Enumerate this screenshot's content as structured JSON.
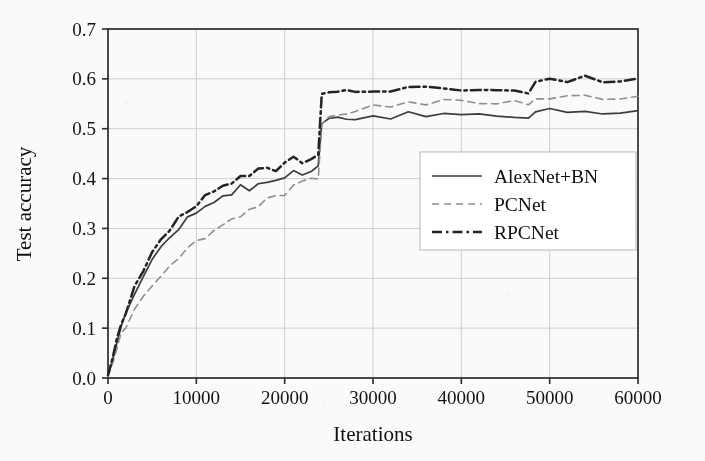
{
  "chart_data": {
    "type": "line",
    "title": "",
    "xlabel": "Iterations",
    "ylabel": "Test accuracy",
    "xlim": [
      0,
      60000
    ],
    "ylim": [
      0.0,
      0.7
    ],
    "xticks": [
      0,
      10000,
      20000,
      30000,
      40000,
      50000,
      60000
    ],
    "xtick_labels": [
      "0",
      "10000",
      "20000",
      "30000",
      "40000",
      "50000",
      "60000"
    ],
    "yticks": [
      0.0,
      0.1,
      0.2,
      0.3,
      0.4,
      0.5,
      0.6,
      0.7
    ],
    "ytick_labels": [
      "0.0",
      "0.1",
      "0.2",
      "0.3",
      "0.4",
      "0.5",
      "0.6",
      "0.7"
    ],
    "grid": true,
    "legend_position": "center-right",
    "annotations": [
      "step increase at ~24000 iterations (learning-rate drop)",
      "second smaller step at ~48000 iterations"
    ],
    "series": [
      {
        "name": "AlexNet+BN",
        "style": "solid",
        "color": "#3d3d3d",
        "x": [
          0,
          500,
          1000,
          1500,
          2000,
          3000,
          4000,
          5000,
          6000,
          7000,
          8000,
          9000,
          10000,
          11000,
          12000,
          13000,
          14000,
          15000,
          16000,
          17000,
          18000,
          19000,
          20000,
          21000,
          22000,
          23000,
          23800,
          24200,
          25000,
          26000,
          27000,
          28000,
          30000,
          32000,
          34000,
          36000,
          38000,
          40000,
          42000,
          44000,
          46000,
          47600,
          48400,
          50000,
          52000,
          54000,
          56000,
          58000,
          60000
        ],
        "y": [
          0.005,
          0.035,
          0.075,
          0.105,
          0.125,
          0.172,
          0.205,
          0.238,
          0.262,
          0.285,
          0.302,
          0.318,
          0.332,
          0.348,
          0.352,
          0.368,
          0.372,
          0.385,
          0.378,
          0.392,
          0.398,
          0.392,
          0.405,
          0.412,
          0.408,
          0.418,
          0.425,
          0.512,
          0.518,
          0.522,
          0.524,
          0.522,
          0.527,
          0.525,
          0.528,
          0.526,
          0.529,
          0.527,
          0.525,
          0.528,
          0.524,
          0.522,
          0.535,
          0.537,
          0.534,
          0.536,
          0.533,
          0.535,
          0.534
        ]
      },
      {
        "name": "PCNet",
        "style": "dashed",
        "color": "#8f8f8f",
        "x": [
          0,
          500,
          1000,
          1500,
          2000,
          3000,
          4000,
          5000,
          6000,
          7000,
          8000,
          9000,
          10000,
          11000,
          12000,
          13000,
          14000,
          15000,
          16000,
          17000,
          18000,
          19000,
          20000,
          21000,
          22000,
          23000,
          23800,
          24200,
          25000,
          26000,
          27000,
          28000,
          30000,
          32000,
          34000,
          36000,
          38000,
          40000,
          42000,
          44000,
          46000,
          47600,
          48400,
          50000,
          52000,
          54000,
          56000,
          58000,
          60000
        ],
        "y": [
          0.003,
          0.028,
          0.062,
          0.088,
          0.105,
          0.138,
          0.165,
          0.188,
          0.208,
          0.228,
          0.245,
          0.258,
          0.272,
          0.285,
          0.295,
          0.308,
          0.318,
          0.328,
          0.338,
          0.348,
          0.358,
          0.365,
          0.372,
          0.382,
          0.39,
          0.398,
          0.405,
          0.515,
          0.522,
          0.528,
          0.532,
          0.538,
          0.545,
          0.548,
          0.55,
          0.552,
          0.553,
          0.552,
          0.554,
          0.553,
          0.552,
          0.551,
          0.562,
          0.564,
          0.563,
          0.565,
          0.563,
          0.564,
          0.563
        ]
      },
      {
        "name": "RPCNet",
        "style": "dashdot",
        "color": "#242424",
        "x": [
          0,
          500,
          1000,
          1500,
          2000,
          3000,
          4000,
          5000,
          6000,
          7000,
          8000,
          9000,
          10000,
          11000,
          12000,
          13000,
          14000,
          15000,
          16000,
          17000,
          18000,
          19000,
          20000,
          21000,
          22000,
          23000,
          23800,
          24200,
          25000,
          26000,
          27000,
          28000,
          30000,
          32000,
          34000,
          36000,
          38000,
          40000,
          42000,
          44000,
          46000,
          47600,
          48400,
          50000,
          52000,
          54000,
          56000,
          58000,
          60000
        ],
        "y": [
          0.006,
          0.038,
          0.08,
          0.112,
          0.132,
          0.18,
          0.215,
          0.248,
          0.275,
          0.298,
          0.318,
          0.332,
          0.348,
          0.362,
          0.372,
          0.385,
          0.395,
          0.405,
          0.402,
          0.415,
          0.422,
          0.418,
          0.428,
          0.438,
          0.432,
          0.442,
          0.448,
          0.568,
          0.572,
          0.576,
          0.578,
          0.577,
          0.58,
          0.578,
          0.582,
          0.579,
          0.583,
          0.58,
          0.578,
          0.581,
          0.578,
          0.576,
          0.597,
          0.6,
          0.598,
          0.601,
          0.598,
          0.6,
          0.599
        ]
      }
    ]
  },
  "legend": {
    "items": [
      {
        "label": "AlexNet+BN",
        "style": "solid"
      },
      {
        "label": "PCNet",
        "style": "dashed"
      },
      {
        "label": "RPCNet",
        "style": "dashdot"
      }
    ]
  },
  "colors": {
    "background": "#fbfaf8",
    "axis": "#2b2b2b",
    "grid": "#c9c9c9",
    "series_alexnet": "#3d3d3d",
    "series_pcnet": "#8f8f8f",
    "series_rpcnet": "#242424"
  }
}
